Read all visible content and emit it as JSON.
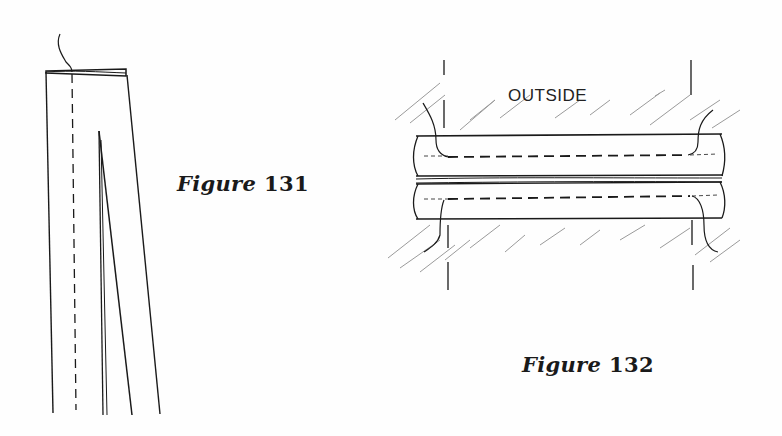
{
  "figures": [
    {
      "id": "fig131",
      "caption_word": "Figure",
      "caption_number": "131",
      "description": "Tapered fabric strip with a stitched top edge, a dashed stitching line, and an inner dart"
    },
    {
      "id": "fig132",
      "caption_word": "Figure",
      "caption_number": "132",
      "label": "OUTSIDE",
      "description": "Two rolled edges with dashed stitching lines, hatched background, vertical guide lines"
    }
  ],
  "colors": {
    "ink": "#1a1a1a",
    "hatch": "#9a9a9a",
    "background": "#fefefe"
  }
}
